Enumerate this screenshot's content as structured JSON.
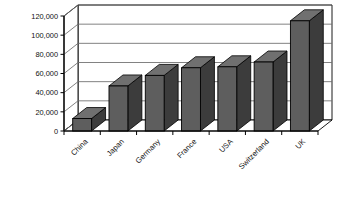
{
  "chart_data": {
    "type": "bar",
    "title": "",
    "subtitle": "",
    "xlabel": "",
    "ylabel": "",
    "categories": [
      "China",
      "Japan",
      "Germany",
      "France",
      "USA",
      "Switzerland",
      "UK"
    ],
    "values": [
      13000,
      47000,
      58000,
      66000,
      67000,
      72000,
      115000
    ],
    "ylim": [
      0,
      120000
    ],
    "ytick_labels": [
      "0",
      "20,000",
      "40,000",
      "60,000",
      "80,000",
      "100,000",
      "120,000"
    ],
    "ytick_values": [
      0,
      20000,
      40000,
      60000,
      80000,
      100000,
      120000
    ],
    "grid": true,
    "legend": false,
    "legend_position": "none",
    "style": "3d-column",
    "colors": {
      "bar_front": "#5e5e5e",
      "bar_side": "#3c3c3c",
      "bar_top": "#707070",
      "bar_outline": "#000000",
      "plot_background": "#ffffff",
      "grid_line": "#6b6b6b",
      "axis_line": "#000000",
      "text": "#111111"
    }
  }
}
